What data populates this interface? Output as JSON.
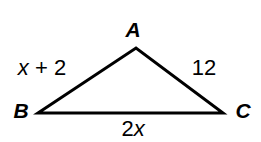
{
  "diagram": {
    "type": "triangle",
    "stroke_color": "#000000",
    "background_color": "#ffffff",
    "stroke_width": 3,
    "vertices": [
      {
        "name": "A",
        "label": "A",
        "x": 136,
        "y": 48
      },
      {
        "name": "B",
        "label": "B",
        "x": 38,
        "y": 113
      },
      {
        "name": "C",
        "label": "C",
        "x": 223,
        "y": 113
      }
    ],
    "vertex_labels": {
      "a": "A",
      "b": "B",
      "c": "C"
    },
    "side_labels": {
      "ab": {
        "full": "x + 2",
        "var": "x",
        "rest": " + 2"
      },
      "ac": {
        "full": "12"
      },
      "bc": {
        "full": "2x",
        "lead": "2",
        "var": "x"
      }
    },
    "polygon_points": "38,113 136,48 223,113"
  }
}
